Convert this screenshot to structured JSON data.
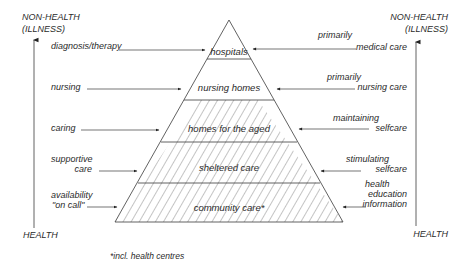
{
  "axes": {
    "left": {
      "top_label_1": "NON-HEALTH",
      "top_label_2": "(ILLNESS)",
      "bottom_label": "HEALTH"
    },
    "right": {
      "top_label_1": "NON-HEALTH",
      "top_label_2": "(ILLNESS)",
      "bottom_label": "HEALTH"
    }
  },
  "pyramid": {
    "tiers": [
      {
        "label": "hospitals",
        "hatched": false
      },
      {
        "label": "nursing homes",
        "hatched": false
      },
      {
        "label": "homes for the aged",
        "hatched": true
      },
      {
        "label": "sheltered care",
        "hatched": true
      },
      {
        "label": "community care*",
        "hatched": true
      }
    ]
  },
  "left_labels": [
    {
      "lines": [
        "diagnosis/therapy"
      ]
    },
    {
      "lines": [
        "nursing"
      ]
    },
    {
      "lines": [
        "caring"
      ]
    },
    {
      "lines": [
        "supportive",
        "care"
      ]
    },
    {
      "lines": [
        "availability",
        "\"on call\""
      ]
    }
  ],
  "right_labels": [
    {
      "lines": [
        "primarily",
        "medical care"
      ]
    },
    {
      "lines": [
        "primarily",
        "nursing care"
      ]
    },
    {
      "lines": [
        "maintaining",
        "selfcare"
      ]
    },
    {
      "lines": [
        "stimulating",
        "selfcare"
      ]
    },
    {
      "lines": [
        "health",
        "education",
        "information"
      ]
    }
  ],
  "footnote": "*incl. health centres"
}
